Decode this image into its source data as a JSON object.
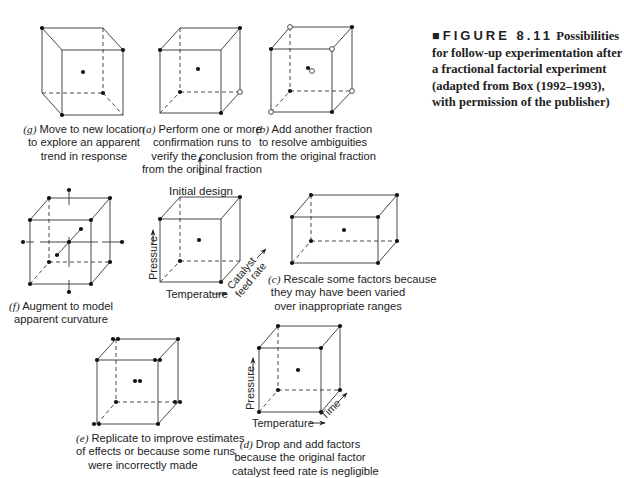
{
  "figure": {
    "label": "FIGURE 8.11",
    "title_rest": "Possibilities for follow-up experimentation after a fractional factorial experiment (adapted from Box (1992–1993), with permission of the publisher)"
  },
  "center": {
    "label": "Initial design",
    "axes": {
      "pressure": "Pressure",
      "temperature": "Temperature",
      "catalyst": "Catalyst feed rate"
    }
  },
  "panels": {
    "g": {
      "letter": "(g)",
      "lines": [
        "Move to new location",
        "to explore an apparent",
        "trend in response"
      ]
    },
    "a": {
      "letter": "(a)",
      "lines": [
        "Perform one or more",
        "confirmation runs to",
        "verify the conclusion",
        "from the original fraction"
      ]
    },
    "b": {
      "letter": "(b)",
      "lines": [
        "Add another fraction",
        "to resolve ambiguities",
        "from the original fraction"
      ]
    },
    "f": {
      "letter": "(f)",
      "lines": [
        "Augment to model",
        "apparent curvature"
      ]
    },
    "c": {
      "letter": "(c)",
      "lines": [
        "Rescale some factors because",
        "they may have been varied",
        "over inappropriate ranges"
      ]
    },
    "e": {
      "letter": "(e)",
      "lines": [
        "Replicate to improve estimates",
        "of effects or because some runs",
        "were incorrectly made"
      ]
    },
    "d": {
      "letter": "(d)",
      "lines": [
        "Drop and add factors",
        "because the original factor",
        "catalyst feed rate is negligible"
      ],
      "axes": {
        "pressure": "Pressure",
        "temperature": "Temperature",
        "time": "Time"
      }
    }
  }
}
